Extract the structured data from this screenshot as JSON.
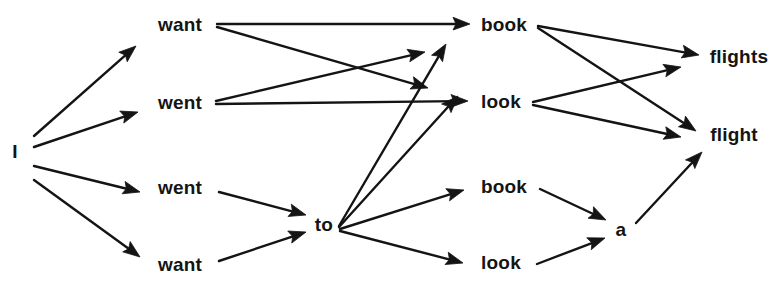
{
  "diagram": {
    "kind": "word-lattice",
    "background_color": "#ffffff",
    "ink_color": "#141414",
    "nodes": [
      {
        "id": "n_i",
        "label": "I",
        "x": 15,
        "y": 151
      },
      {
        "id": "n_want_1",
        "label": "want",
        "x": 180,
        "y": 24
      },
      {
        "id": "n_went_1",
        "label": "went",
        "x": 180,
        "y": 102
      },
      {
        "id": "n_went_2",
        "label": "went",
        "x": 180,
        "y": 187
      },
      {
        "id": "n_want_2",
        "label": "want",
        "x": 180,
        "y": 264
      },
      {
        "id": "n_to",
        "label": "to",
        "x": 324,
        "y": 224
      },
      {
        "id": "n_book_1",
        "label": "book",
        "x": 504,
        "y": 24
      },
      {
        "id": "n_look_1",
        "label": "look",
        "x": 501,
        "y": 101
      },
      {
        "id": "n_book_2",
        "label": "book",
        "x": 504,
        "y": 186
      },
      {
        "id": "n_look_2",
        "label": "look",
        "x": 501,
        "y": 262
      },
      {
        "id": "n_a",
        "label": "a",
        "x": 621,
        "y": 229
      },
      {
        "id": "n_flights",
        "label": "flights",
        "x": 739,
        "y": 56
      },
      {
        "id": "n_flight",
        "label": "flight",
        "x": 734,
        "y": 134
      }
    ],
    "edges": [
      {
        "id": "e1",
        "from": "n_i",
        "to": "n_want_1",
        "x1": 34,
        "y1": 136,
        "x2": 136,
        "y2": 46
      },
      {
        "id": "e2",
        "from": "n_i",
        "to": "n_went_1",
        "x1": 34,
        "y1": 147,
        "x2": 138,
        "y2": 112
      },
      {
        "id": "e3",
        "from": "n_i",
        "to": "n_went_2",
        "x1": 34,
        "y1": 166,
        "x2": 140,
        "y2": 192
      },
      {
        "id": "e4",
        "from": "n_i",
        "to": "n_want_2",
        "x1": 34,
        "y1": 180,
        "x2": 140,
        "y2": 257
      },
      {
        "id": "e5",
        "from": "n_want_1",
        "to": "n_book_1",
        "x1": 217,
        "y1": 24,
        "x2": 470,
        "y2": 24
      },
      {
        "id": "e6",
        "from": "n_want_1",
        "to": "n_look_1x",
        "x1": 217,
        "y1": 27,
        "x2": 428,
        "y2": 88
      },
      {
        "id": "e7",
        "from": "n_went_1",
        "to": "n_book_1x",
        "x1": 216,
        "y1": 101,
        "x2": 425,
        "y2": 52
      },
      {
        "id": "e8",
        "from": "n_went_1",
        "to": "n_look_1",
        "x1": 216,
        "y1": 104,
        "x2": 468,
        "y2": 101
      },
      {
        "id": "e9",
        "from": "n_went_2",
        "to": "n_to",
        "x1": 219,
        "y1": 192,
        "x2": 306,
        "y2": 215
      },
      {
        "id": "e10",
        "from": "n_want_2",
        "to": "n_to",
        "x1": 219,
        "y1": 261,
        "x2": 306,
        "y2": 232
      },
      {
        "id": "e11",
        "from": "n_to",
        "to": "n_book_1t",
        "x1": 339,
        "y1": 226,
        "x2": 446,
        "y2": 44
      },
      {
        "id": "e12",
        "from": "n_to",
        "to": "n_look_1t",
        "x1": 339,
        "y1": 227,
        "x2": 458,
        "y2": 96
      },
      {
        "id": "e13",
        "from": "n_to",
        "to": "n_book_2",
        "x1": 340,
        "y1": 229,
        "x2": 464,
        "y2": 190
      },
      {
        "id": "e14",
        "from": "n_to",
        "to": "n_look_2",
        "x1": 340,
        "y1": 231,
        "x2": 463,
        "y2": 263
      },
      {
        "id": "e15",
        "from": "n_book_1",
        "to": "n_flights",
        "x1": 538,
        "y1": 26,
        "x2": 699,
        "y2": 55
      },
      {
        "id": "e16",
        "from": "n_book_1",
        "to": "n_flight",
        "x1": 538,
        "y1": 28,
        "x2": 696,
        "y2": 131
      },
      {
        "id": "e17",
        "from": "n_look_1",
        "to": "n_flights",
        "x1": 533,
        "y1": 102,
        "x2": 681,
        "y2": 67
      },
      {
        "id": "e18",
        "from": "n_look_1",
        "to": "n_flight",
        "x1": 533,
        "y1": 105,
        "x2": 681,
        "y2": 137
      },
      {
        "id": "e19",
        "from": "n_book_2",
        "to": "n_a",
        "x1": 540,
        "y1": 189,
        "x2": 606,
        "y2": 220
      },
      {
        "id": "e20",
        "from": "n_look_2",
        "to": "n_a",
        "x1": 537,
        "y1": 264,
        "x2": 605,
        "y2": 238
      },
      {
        "id": "e21",
        "from": "n_a",
        "to": "n_flight",
        "x1": 636,
        "y1": 223,
        "x2": 702,
        "y2": 152
      }
    ]
  }
}
